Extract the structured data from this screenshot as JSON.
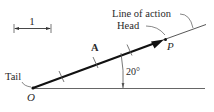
{
  "diagram": {
    "scale_bar": {
      "label": "1"
    },
    "vector": {
      "label": "A",
      "head_label": "Head",
      "tail_label": "Tail"
    },
    "points": {
      "origin": "O",
      "point": "P"
    },
    "line_of_action_label": "Line of action",
    "angle": {
      "label": "20°",
      "value_deg": 20
    },
    "colors": {
      "stroke": "#1a1a1a",
      "thin": "#555555",
      "text": "#2a2a2a"
    }
  }
}
